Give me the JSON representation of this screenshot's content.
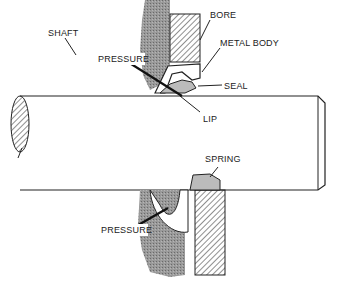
{
  "diagram": {
    "labels": {
      "bore": "BORE",
      "metal_body": "METAL BODY",
      "seal": "SEAL",
      "lip": "LIP",
      "shaft": "SHAFT",
      "pressure_top": "PRESSURE",
      "spring": "SPRING",
      "pressure_bottom": "PRESSURE"
    },
    "colors": {
      "stroke": "#222222",
      "housing_gray": "#8a8a8a",
      "background": "#ffffff"
    }
  }
}
